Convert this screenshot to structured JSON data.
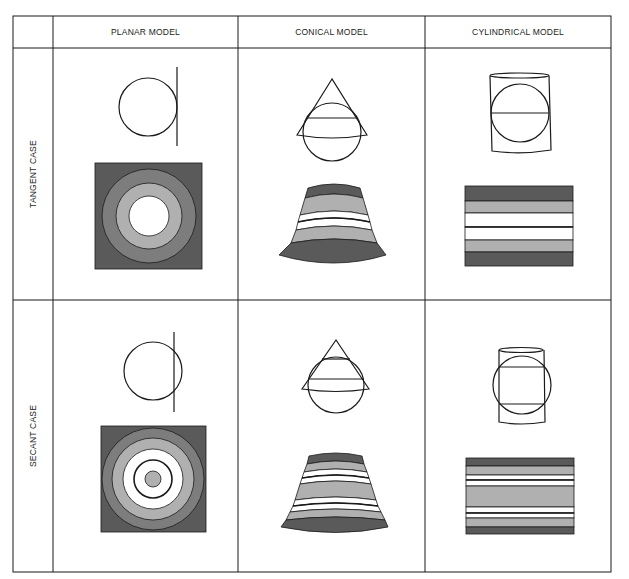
{
  "figure": {
    "columns": [
      {
        "label": "PLANAR MODEL"
      },
      {
        "label": "CONICAL MODEL"
      },
      {
        "label": "CYLINDRICAL MODEL"
      }
    ],
    "rows": [
      {
        "label": "TANGENT CASE"
      },
      {
        "label": "SECANT CASE"
      }
    ],
    "cells": [
      {
        "row": "TANGENT CASE",
        "column": "PLANAR MODEL",
        "schematic": "circle with vertical plane touching at one point",
        "pattern": "square with concentric rings: white center, light gray, mid gray, dark gray"
      },
      {
        "row": "TANGENT CASE",
        "column": "CONICAL MODEL",
        "schematic": "cone over circle touching along one parallel",
        "pattern": "fan segment bands: dark, light, white, line, white, light, dark"
      },
      {
        "row": "TANGENT CASE",
        "column": "CYLINDRICAL MODEL",
        "schematic": "cylinder around circle touching along equator",
        "pattern": "rectangle bands: dark, light, white, line, white, light, dark"
      },
      {
        "row": "SECANT CASE",
        "column": "PLANAR MODEL",
        "schematic": "circle cut by vertical plane",
        "pattern": "square with concentric rings: light gray center dot, standard line circle, white, light, mid, dark"
      },
      {
        "row": "SECANT CASE",
        "column": "CONICAL MODEL",
        "schematic": "cone cutting circle along two parallels",
        "pattern": "fan segment bands with two standard lines"
      },
      {
        "row": "SECANT CASE",
        "column": "CYLINDRICAL MODEL",
        "schematic": "cylinder cutting circle along two parallels",
        "pattern": "rectangle bands with two standard lines"
      }
    ]
  },
  "colors": {
    "line": "#1a1a1a",
    "dark": "#5a5a5a",
    "mid": "#7d7d7d",
    "light": "#b0b0b0",
    "white": "#ffffff"
  }
}
